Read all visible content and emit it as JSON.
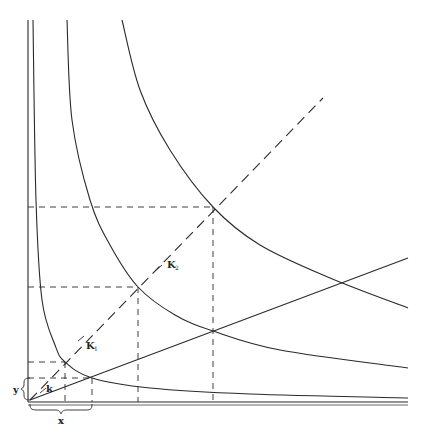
{
  "diagram": {
    "type": "indifference-curves-with-expansion-path",
    "stroke_color": "#2a2a2a",
    "background": "#ffffff",
    "labels": {
      "x_axis": "x",
      "y_axis": "y",
      "k0": "k",
      "k1": "K",
      "k1_sub": "1",
      "k2": "K",
      "k2_sub": "2"
    },
    "curves": [
      {
        "name": "curve-inner",
        "points": [
          [
            33,
            20
          ],
          [
            36,
            200
          ],
          [
            42,
            300
          ],
          [
            55,
            345
          ],
          [
            65,
            362
          ],
          [
            92,
            378
          ],
          [
            150,
            388
          ],
          [
            250,
            394
          ],
          [
            408,
            398
          ]
        ]
      },
      {
        "name": "curve-middle",
        "points": [
          [
            67,
            20
          ],
          [
            72,
            120
          ],
          [
            90,
            200
          ],
          [
            110,
            245
          ],
          [
            138,
            287
          ],
          [
            175,
            315
          ],
          [
            213,
            331
          ],
          [
            280,
            350
          ],
          [
            408,
            368
          ]
        ]
      },
      {
        "name": "curve-outer",
        "points": [
          [
            122,
            20
          ],
          [
            140,
            90
          ],
          [
            170,
            150
          ],
          [
            213,
            207
          ],
          [
            260,
            245
          ],
          [
            330,
            278
          ],
          [
            408,
            308
          ]
        ]
      }
    ],
    "dashed_ray": {
      "from": [
        30,
        400
      ],
      "to": [
        323,
        98
      ]
    },
    "solid_ray": {
      "from": [
        30,
        400
      ],
      "to": [
        408,
        258
      ]
    },
    "tangency_points": [
      [
        65,
        362
      ],
      [
        138,
        287
      ],
      [
        213,
        207
      ]
    ],
    "ray_intersections": [
      [
        92,
        378
      ],
      [
        213,
        331
      ]
    ]
  }
}
